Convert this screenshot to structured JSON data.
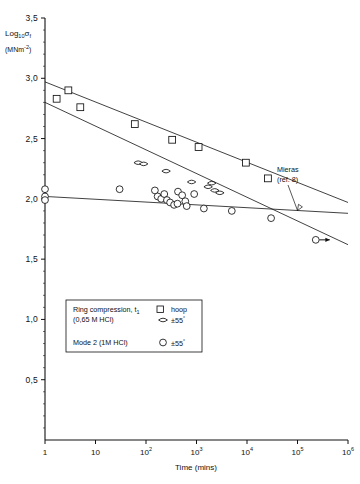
{
  "chart_data": {
    "type": "scatter",
    "title": "",
    "xlabel": "Time (mins)",
    "ylabel": "Log10 σf",
    "ylabel_units": "(MNm⁻²)",
    "xscale": "log",
    "xlim": [
      1,
      1000000
    ],
    "ylim": [
      0,
      3.5
    ],
    "grid": false,
    "legend_position": "lower-left-inside",
    "xticks": [
      {
        "value": 1,
        "label": "1",
        "mantissa": "1",
        "exponent": ""
      },
      {
        "value": 10,
        "label": "10",
        "mantissa": "10",
        "exponent": ""
      },
      {
        "value": 100,
        "label": "10^2",
        "mantissa": "10",
        "exponent": "2"
      },
      {
        "value": 1000,
        "label": "10^3",
        "mantissa": "10",
        "exponent": "3"
      },
      {
        "value": 10000,
        "label": "10^4",
        "mantissa": "10",
        "exponent": "4"
      },
      {
        "value": 100000,
        "label": "10^5",
        "mantissa": "10",
        "exponent": "5"
      },
      {
        "value": 1000000,
        "label": "10^6",
        "mantissa": "10",
        "exponent": "6"
      }
    ],
    "yticks": [
      {
        "value": 0.5,
        "label": "0,5"
      },
      {
        "value": 1.0,
        "label": "1,0"
      },
      {
        "value": 1.5,
        "label": "1,5"
      },
      {
        "value": 2.0,
        "label": "2,0"
      },
      {
        "value": 2.5,
        "label": "2,5"
      },
      {
        "value": 3.0,
        "label": "3,0"
      },
      {
        "value": 3.5,
        "label": "3,5"
      }
    ],
    "series": [
      {
        "name": "Ring compression, t1 (0,65 M HCl) — hoop",
        "marker": "square",
        "points": [
          {
            "x": 1.7,
            "y": 2.83
          },
          {
            "x": 2.9,
            "y": 2.9
          },
          {
            "x": 5.0,
            "y": 2.76
          },
          {
            "x": 60,
            "y": 2.62
          },
          {
            "x": 330,
            "y": 2.49
          },
          {
            "x": 1100,
            "y": 2.43
          },
          {
            "x": 9500,
            "y": 2.3
          },
          {
            "x": 26000,
            "y": 2.17
          }
        ]
      },
      {
        "name": "Ring compression, t1 (0,65 M HCl) — ±55°",
        "marker": "lens",
        "points": [
          {
            "x": 70,
            "y": 2.3
          },
          {
            "x": 90,
            "y": 2.29
          },
          {
            "x": 250,
            "y": 2.23
          },
          {
            "x": 800,
            "y": 2.14
          },
          {
            "x": 1700,
            "y": 2.1
          },
          {
            "x": 2300,
            "y": 2.07
          },
          {
            "x": 2900,
            "y": 2.05
          },
          {
            "x": 2000,
            "y": 2.13
          }
        ]
      },
      {
        "name": "Mode 2 (1M HCl) ±55°",
        "marker": "circle",
        "points": [
          {
            "x": 1.0,
            "y": 2.08
          },
          {
            "x": 1.0,
            "y": 2.02
          },
          {
            "x": 1.0,
            "y": 1.99
          },
          {
            "x": 30,
            "y": 2.08
          },
          {
            "x": 150,
            "y": 2.07
          },
          {
            "x": 170,
            "y": 2.02
          },
          {
            "x": 200,
            "y": 2.0
          },
          {
            "x": 230,
            "y": 2.04
          },
          {
            "x": 260,
            "y": 1.99
          },
          {
            "x": 300,
            "y": 1.97
          },
          {
            "x": 360,
            "y": 1.95
          },
          {
            "x": 420,
            "y": 1.96
          },
          {
            "x": 430,
            "y": 2.06
          },
          {
            "x": 520,
            "y": 2.03
          },
          {
            "x": 600,
            "y": 1.98
          },
          {
            "x": 640,
            "y": 1.94
          },
          {
            "x": 900,
            "y": 2.04
          },
          {
            "x": 1400,
            "y": 1.92
          },
          {
            "x": 5000,
            "y": 1.9
          },
          {
            "x": 30000,
            "y": 1.84
          },
          {
            "x": 230000,
            "y": 1.66
          }
        ]
      }
    ],
    "trend_lines": [
      {
        "name": "hoop-fit",
        "x1": 1,
        "y1": 2.97,
        "x2": 1000000,
        "y2": 1.97
      },
      {
        "name": "pm55-fit",
        "x1": 1,
        "y1": 2.8,
        "x2": 1000000,
        "y2": 1.62
      },
      {
        "name": "mieras-line",
        "x1": 1,
        "y1": 2.02,
        "x2": 1000000,
        "y2": 1.88
      }
    ],
    "annotations": [
      {
        "name": "mieras",
        "line1": "Mieras",
        "line2": "(ref. 8)"
      }
    ],
    "runout_marker": {
      "name": "runout-arrow",
      "x": 230000,
      "y": 1.66,
      "direction": "right"
    }
  },
  "legend": {
    "row1": {
      "title": "Ring compression,",
      "sub": "t",
      "subscript": "1",
      "marker": "square",
      "label": "hoop"
    },
    "row2": {
      "title": "(0,65 M HCl)",
      "marker": "lens",
      "label": "±55",
      "degree": "°"
    },
    "row3": {
      "title": "Mode  2 (1M HCl)",
      "marker": "circle",
      "label": "±55",
      "degree": "°"
    }
  },
  "axes": {
    "ylabel_main": "Log",
    "ylabel_sub": "10",
    "ylabel_sym": "σ",
    "ylabel_symsub": "f",
    "ylabel_units": "(MNm",
    "ylabel_units_exp": "-2",
    "ylabel_units_end": ")",
    "xlabel": "Time (mins)"
  },
  "colors": {
    "ink": "#111111",
    "background": "#ffffff"
  }
}
